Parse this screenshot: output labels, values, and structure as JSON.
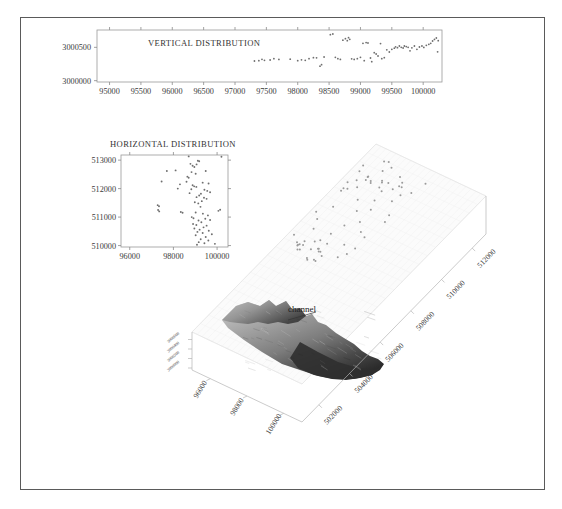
{
  "figure": {
    "background_color": "#ffffff",
    "frame_color": "#5a5a5a",
    "annotation_label": "channel"
  },
  "chart_data": [
    {
      "type": "scatter",
      "name": "vertical-distribution",
      "title": "VERTICAL DISTRIBUTION",
      "xlabel": "",
      "ylabel": "",
      "grid": false,
      "xlim": [
        94800,
        100300
      ],
      "ylim": [
        2999980,
        3000760
      ],
      "xticks": [
        95000,
        95500,
        96000,
        96500,
        97000,
        97500,
        98000,
        98500,
        99000,
        99500,
        100000
      ],
      "xticklabels": [
        "95000",
        "95500",
        "96000",
        "96500",
        "97000",
        "97500",
        "98000",
        "98500",
        "99000",
        "99500",
        "100000"
      ],
      "yticks": [
        3000000,
        3000500
      ],
      "yticklabels": [
        "3000000",
        "3000500"
      ],
      "points": [
        [
          97310,
          3000295
        ],
        [
          97380,
          3000300
        ],
        [
          97430,
          3000320
        ],
        [
          97470,
          3000305
        ],
        [
          97560,
          3000310
        ],
        [
          97620,
          3000330
        ],
        [
          97700,
          3000318
        ],
        [
          97880,
          3000322
        ],
        [
          98000,
          3000300
        ],
        [
          98060,
          3000312
        ],
        [
          98120,
          3000305
        ],
        [
          98180,
          3000330
        ],
        [
          98250,
          3000345
        ],
        [
          98300,
          3000342
        ],
        [
          98355,
          3000218
        ],
        [
          98380,
          3000240
        ],
        [
          98420,
          3000355
        ],
        [
          98520,
          3000690
        ],
        [
          98560,
          3000700
        ],
        [
          98600,
          3000350
        ],
        [
          98640,
          3000330
        ],
        [
          98680,
          3000318
        ],
        [
          98720,
          3000608
        ],
        [
          98760,
          3000630
        ],
        [
          98790,
          3000600
        ],
        [
          98810,
          3000645
        ],
        [
          98830,
          3000620
        ],
        [
          98860,
          3000328
        ],
        [
          98900,
          3000318
        ],
        [
          98950,
          3000330
        ],
        [
          99000,
          3000350
        ],
        [
          99040,
          3000560
        ],
        [
          99060,
          3000300
        ],
        [
          99090,
          3000572
        ],
        [
          99120,
          3000565
        ],
        [
          99160,
          3000340
        ],
        [
          99180,
          3000285
        ],
        [
          99220,
          3000420
        ],
        [
          99250,
          3000400
        ],
        [
          99280,
          3000370
        ],
        [
          99320,
          3000556
        ],
        [
          99340,
          3000330
        ],
        [
          99380,
          3000345
        ],
        [
          99420,
          3000462
        ],
        [
          99460,
          3000430
        ],
        [
          99500,
          3000470
        ],
        [
          99540,
          3000488
        ],
        [
          99560,
          3000508
        ],
        [
          99590,
          3000495
        ],
        [
          99620,
          3000520
        ],
        [
          99650,
          3000500
        ],
        [
          99680,
          3000490
        ],
        [
          99700,
          3000520
        ],
        [
          99730,
          3000512
        ],
        [
          99760,
          3000500
        ],
        [
          99790,
          3000448
        ],
        [
          99820,
          3000492
        ],
        [
          99860,
          3000520
        ],
        [
          99900,
          3000470
        ],
        [
          99940,
          3000505
        ],
        [
          99980,
          3000520
        ],
        [
          100010,
          3000498
        ],
        [
          100050,
          3000530
        ],
        [
          100090,
          3000545
        ],
        [
          100120,
          3000560
        ],
        [
          100150,
          3000595
        ],
        [
          100180,
          3000618
        ],
        [
          100210,
          3000640
        ],
        [
          100230,
          3000432
        ],
        [
          100240,
          3000600
        ]
      ]
    },
    {
      "type": "scatter",
      "name": "horizontal-distribution",
      "title": "HORIZONTAL DISTRIBUTION",
      "xlabel": "",
      "ylabel": "",
      "grid": false,
      "xlim": [
        95600,
        100500
      ],
      "ylim": [
        509950,
        513180
      ],
      "xticks": [
        96000,
        98000,
        100000
      ],
      "xticklabels": [
        "96000",
        "98000",
        "100000"
      ],
      "yticks": [
        510000,
        511000,
        512000,
        513000
      ],
      "yticklabels": [
        "510000",
        "511000",
        "512000",
        "513000"
      ],
      "points": [
        [
          98700,
          513130
        ],
        [
          100200,
          513120
        ],
        [
          99120,
          512980
        ],
        [
          99180,
          512960
        ],
        [
          98780,
          512870
        ],
        [
          99060,
          512850
        ],
        [
          98880,
          512800
        ],
        [
          98960,
          512760
        ],
        [
          97700,
          512620
        ],
        [
          98100,
          512640
        ],
        [
          99480,
          512620
        ],
        [
          98830,
          512580
        ],
        [
          99020,
          512520
        ],
        [
          98640,
          512420
        ],
        [
          98700,
          512380
        ],
        [
          97460,
          512250
        ],
        [
          98600,
          512240
        ],
        [
          99340,
          512210
        ],
        [
          99610,
          512180
        ],
        [
          98300,
          512150
        ],
        [
          98880,
          512120
        ],
        [
          98950,
          512080
        ],
        [
          99050,
          512060
        ],
        [
          98200,
          512000
        ],
        [
          98820,
          511980
        ],
        [
          99420,
          511960
        ],
        [
          99550,
          511920
        ],
        [
          99680,
          511870
        ],
        [
          98740,
          511840
        ],
        [
          99260,
          511820
        ],
        [
          99180,
          511760
        ],
        [
          99060,
          511700
        ],
        [
          99400,
          511680
        ],
        [
          99520,
          511640
        ],
        [
          99300,
          511560
        ],
        [
          98980,
          511520
        ],
        [
          99140,
          511480
        ],
        [
          97280,
          511420
        ],
        [
          97340,
          511380
        ],
        [
          99240,
          511360
        ],
        [
          97300,
          511250
        ],
        [
          97350,
          511200
        ],
        [
          98340,
          511180
        ],
        [
          98420,
          511150
        ],
        [
          99020,
          511160
        ],
        [
          99350,
          511120
        ],
        [
          100060,
          511220
        ],
        [
          100140,
          511260
        ],
        [
          99580,
          511060
        ],
        [
          98840,
          511000
        ],
        [
          98920,
          510960
        ],
        [
          99460,
          510940
        ],
        [
          99680,
          510900
        ],
        [
          99150,
          510880
        ],
        [
          99280,
          510820
        ],
        [
          98900,
          510760
        ],
        [
          99050,
          510720
        ],
        [
          99520,
          510700
        ],
        [
          99380,
          510640
        ],
        [
          98960,
          510600
        ],
        [
          99200,
          510560
        ],
        [
          99620,
          510520
        ],
        [
          99100,
          510480
        ],
        [
          99340,
          510440
        ],
        [
          99760,
          510400
        ],
        [
          99020,
          510360
        ],
        [
          99480,
          510300
        ],
        [
          99250,
          510220
        ],
        [
          99600,
          510180
        ],
        [
          99160,
          510120
        ],
        [
          99420,
          510080
        ],
        [
          99900,
          510060
        ],
        [
          99080,
          510030
        ]
      ]
    },
    {
      "type": "scatter3d",
      "name": "three-d-block-diagram",
      "title": "",
      "x_axis": {
        "name": "easting",
        "ticklabels": [
          "96000",
          "98000",
          "100000"
        ]
      },
      "y_axis": {
        "name": "northing",
        "ticklabels": [
          "502000",
          "504000",
          "506000",
          "508000",
          "510000",
          "512000"
        ]
      },
      "z_axis": {
        "name": "depth",
        "ticklabels": [
          "3000000",
          "3000200",
          "3000400",
          "3000600"
        ]
      },
      "annotation": "channel",
      "well_points_count": 72
    }
  ]
}
